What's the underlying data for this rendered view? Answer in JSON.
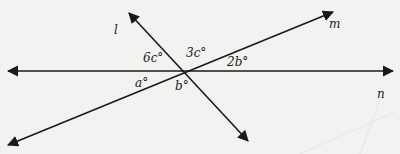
{
  "diagram": {
    "type": "intersecting-lines-angles",
    "background": "#f2f2f0",
    "line_color": "#1a1a1a",
    "lines": [
      {
        "name": "l",
        "label": "l"
      },
      {
        "name": "m",
        "label": "m"
      },
      {
        "name": "n",
        "label": "n"
      }
    ],
    "angles": [
      {
        "label": "6c°"
      },
      {
        "label": "3c°"
      },
      {
        "label": "2b°"
      },
      {
        "label": "a°"
      },
      {
        "label": "b°"
      }
    ]
  }
}
